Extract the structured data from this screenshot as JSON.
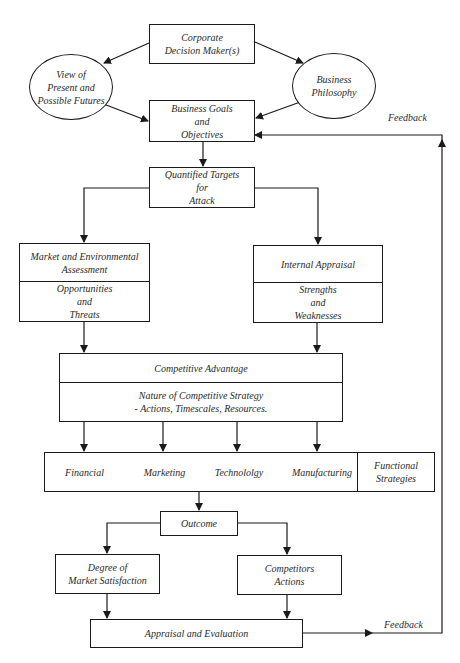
{
  "header": {
    "fragment": ""
  },
  "nodes": {
    "corporate": {
      "lines": [
        "Corporate",
        "Decision Maker(s)"
      ]
    },
    "view": {
      "lines": [
        "View of",
        "Present and",
        "Possible Futures"
      ]
    },
    "philosophy": {
      "lines": [
        "Business",
        "Philosophy"
      ]
    },
    "goals": {
      "lines": [
        "Business Goals",
        "and",
        "Objectives"
      ]
    },
    "targets": {
      "lines": [
        "Quantified Targets",
        "for",
        "Attack"
      ]
    },
    "market": {
      "top": [
        "Market and Environmental",
        "Assessment"
      ],
      "bottom": [
        "Opportunities",
        "and",
        "Threats"
      ]
    },
    "internal": {
      "top": [
        "Internal Appraisal"
      ],
      "bottom": [
        "Strengths",
        "and",
        "Weaknesses"
      ]
    },
    "competitive": {
      "top": [
        "Competitive Advantage"
      ],
      "bottom": [
        "Nature of Competitive Strategy",
        "- Actions, Timescales, Resources."
      ]
    },
    "functions": {
      "items": [
        "Financial",
        "Marketing",
        "Technololgy",
        "Manufacturing"
      ],
      "group_label": [
        "Functional",
        "Strategies"
      ]
    },
    "outcome": {
      "lines": [
        "Outcome"
      ]
    },
    "satisfaction": {
      "lines": [
        "Degree of",
        "Market Satisfaction"
      ]
    },
    "competitors": {
      "lines": [
        "Competitors",
        "Actions"
      ]
    },
    "appraisal": {
      "lines": [
        "Appraisal and Evaluation"
      ]
    }
  },
  "labels": {
    "feedback_top": "Feedback",
    "feedback_bottom": "Feedback"
  },
  "colors": {
    "stroke": "#1a1a1a",
    "text": "#2a2a2a",
    "background": "#ffffff"
  }
}
